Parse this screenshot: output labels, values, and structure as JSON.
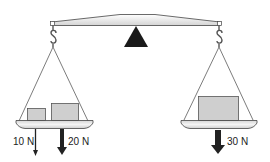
{
  "diagram": {
    "type": "balance-scale",
    "colors": {
      "outline": "#333333",
      "fill_light": "#e6e6e6",
      "box_fill": "#cfcfcf",
      "fulcrum": "#1a1a1a",
      "arrow": "#222222",
      "string": "#444444"
    },
    "left_pan": {
      "boxes": [
        {
          "name": "small-box",
          "force": "10 N"
        },
        {
          "name": "large-box",
          "force": "20 N"
        }
      ],
      "force_labels": {
        "small": "10 N",
        "large": "20 N"
      }
    },
    "right_pan": {
      "boxes": [
        {
          "name": "box",
          "force": "30 N"
        }
      ],
      "force_labels": {
        "box": "30 N"
      }
    }
  }
}
